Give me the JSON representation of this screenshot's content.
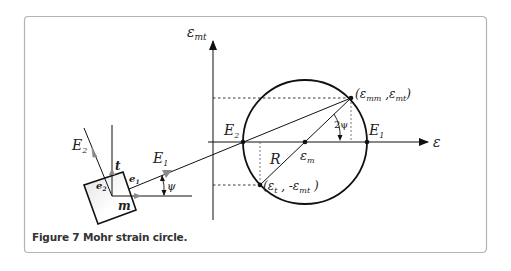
{
  "figure": {
    "caption": "Figure 7 Mohr strain circle.",
    "frame_color": "#b3b3b3"
  },
  "axes": {
    "y_label_main": "ε",
    "y_label_sub": "mt",
    "x_label": "ε"
  },
  "circle": {
    "center_label_main": "ε",
    "center_label_sub": "m",
    "radius_label": "R",
    "left_point_label_main": "E",
    "left_point_label_sub": "2",
    "right_point_label_main": "E",
    "right_point_label_sub": "1",
    "angle_label": "2ψ",
    "top_point_label": {
      "open": "(",
      "a_main": "ε",
      "a_sub": "mm",
      "sep": " ,",
      "b_main": "ε",
      "b_sub": "mt",
      "close": ")"
    },
    "bottom_point_label": {
      "open": "(",
      "a_main": "ε",
      "a_sub": "t",
      "sep": " , -",
      "b_main": "ε",
      "b_sub": "mt",
      "close": " )"
    }
  },
  "element": {
    "E1_main": "E",
    "E1_sub": "1",
    "E2_main": "E",
    "E2_sub": "2",
    "t_label": "t",
    "m_label": "m",
    "e1_main": "e",
    "e1_sub": "1",
    "e2_main": "e",
    "e2_sub": "2",
    "psi_label": "ψ",
    "arrow_color": "#8a8a8a",
    "fill_gradient_start": "#e6e6e6"
  }
}
